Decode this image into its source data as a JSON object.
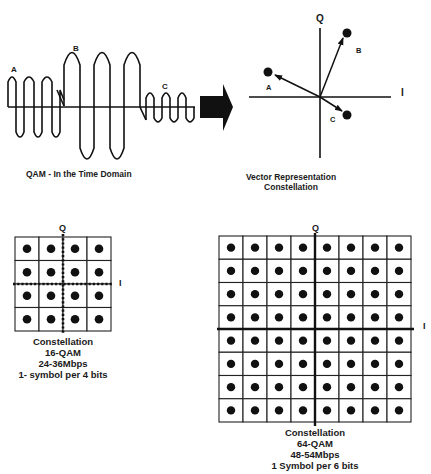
{
  "time_domain": {
    "caption": "QAM - In the Time Domain",
    "labels": [
      "A",
      "B",
      "C"
    ]
  },
  "arrow": {
    "icon": "right-arrow-icon"
  },
  "vector": {
    "axis_q": "Q",
    "axis_i": "I",
    "points": [
      {
        "label": "A",
        "x": 270,
        "y": 72
      },
      {
        "label": "B",
        "x": 347,
        "y": 33
      },
      {
        "label": "C",
        "x": 347,
        "y": 114
      }
    ],
    "caption_line1": "Vector Representation",
    "caption_line2": "Constellation"
  },
  "qam16": {
    "axis_q": "Q",
    "axis_i": "I",
    "rows": 4,
    "cols": 4,
    "caption": [
      "Constellation",
      "16-QAM",
      "24-36Mbps",
      "1- symbol per 4 bits"
    ]
  },
  "qam64": {
    "axis_q": "Q",
    "axis_i": "I",
    "rows": 8,
    "cols": 8,
    "caption": [
      "Constellation",
      "64-QAM",
      "48-54Mbps",
      "1 Symbol per 6 bits"
    ]
  },
  "colors": {
    "ink": "#111111",
    "background": "#ffffff"
  }
}
